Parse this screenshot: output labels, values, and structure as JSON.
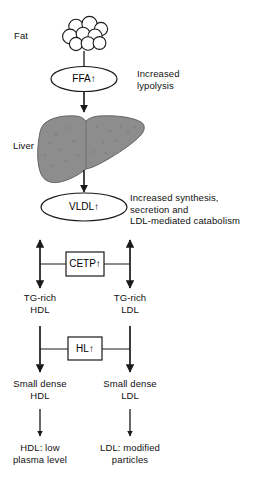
{
  "diagram": {
    "colors": {
      "stroke": "#1a1a1a",
      "text": "#111111",
      "liver_fill": "#8d8d8d",
      "background": "#ffffff"
    },
    "labels": {
      "fat": "Fat",
      "liver": "Liver",
      "increased_lypolysis": "Increased\nlypolysis",
      "increased_synthesis": "Increased synthesis,\nsecretion and\nLDL-mediated catabolism",
      "tg_rich_hdl": "TG-rich\nHDL",
      "tg_rich_ldl": "TG-rich\nLDL",
      "small_dense_hdl": "Small dense\nHDL",
      "small_dense_ldl": "Small dense\nLDL",
      "hdl_outcome": "HDL: low\nplasma level",
      "ldl_outcome": "LDL: modified\nparticles"
    },
    "nodes": {
      "ffa": "FFA↑",
      "vldl": "VLDL↑",
      "cetp": "CETP↑",
      "hl": "HL↑"
    },
    "icons": {
      "fat_globules": "fat-globule-cluster-icon",
      "liver": "liver-organ-icon"
    }
  }
}
